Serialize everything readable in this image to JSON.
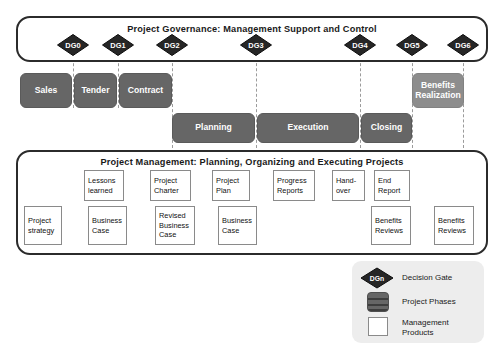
{
  "governance": {
    "title": "Project Governance: Management Support and Control",
    "gates": [
      {
        "label": "DG0",
        "x": 73
      },
      {
        "label": "DG1",
        "x": 118
      },
      {
        "label": "DG2",
        "x": 172
      },
      {
        "label": "DG3",
        "x": 256
      },
      {
        "label": "DG4",
        "x": 360
      },
      {
        "label": "DG5",
        "x": 412
      },
      {
        "label": "DG6",
        "x": 463
      }
    ]
  },
  "phases_row1": [
    {
      "label": "Sales",
      "x": 20,
      "w": 52
    },
    {
      "label": "Tender",
      "x": 74,
      "w": 43
    },
    {
      "label": "Contract",
      "x": 119,
      "w": 53
    },
    {
      "label": "Benefits Realization",
      "x": 412,
      "w": 52,
      "tone": "light"
    }
  ],
  "phases_row2": [
    {
      "label": "Planning",
      "x": 172,
      "w": 83
    },
    {
      "label": "Execution",
      "x": 257,
      "w": 102
    },
    {
      "label": "Closing",
      "x": 361,
      "w": 51
    }
  ],
  "management": {
    "title": "Project Management: Planning, Organizing and Executing Projects",
    "products_top": [
      {
        "label": "Lessons learned",
        "x": 84,
        "w": 40
      },
      {
        "label": "Project Charter",
        "x": 150,
        "w": 41
      },
      {
        "label": "Project Plan",
        "x": 212,
        "w": 38
      },
      {
        "label": "Progress Reports",
        "x": 273,
        "w": 42
      },
      {
        "label": "Hand- over",
        "x": 332,
        "w": 33
      },
      {
        "label": "End Report",
        "x": 374,
        "w": 36
      }
    ],
    "products_bottom": [
      {
        "label": "Project strategy",
        "x": 24,
        "w": 38
      },
      {
        "label": "Business Case",
        "x": 88,
        "w": 39
      },
      {
        "label": "Revised Business Case",
        "x": 155,
        "w": 40
      },
      {
        "label": "Business Case",
        "x": 218,
        "w": 39
      },
      {
        "label": "Benefits Reviews",
        "x": 371,
        "w": 40
      },
      {
        "label": "Benefits Reviews",
        "x": 434,
        "w": 40
      }
    ]
  },
  "legend": {
    "items": [
      {
        "label": "Decision Gate",
        "swatch": "gate-diamond",
        "gate_label": "DGn"
      },
      {
        "label": "Project Phases",
        "swatch": "phase-block"
      },
      {
        "label": "Management Products",
        "swatch": "product-block"
      }
    ]
  },
  "colors": {
    "phase_dark": "#666666",
    "phase_light": "#8d8d8d",
    "gate_fill": "#262626",
    "outline": "#2b2b2b",
    "legend_bg": "#ededed"
  }
}
